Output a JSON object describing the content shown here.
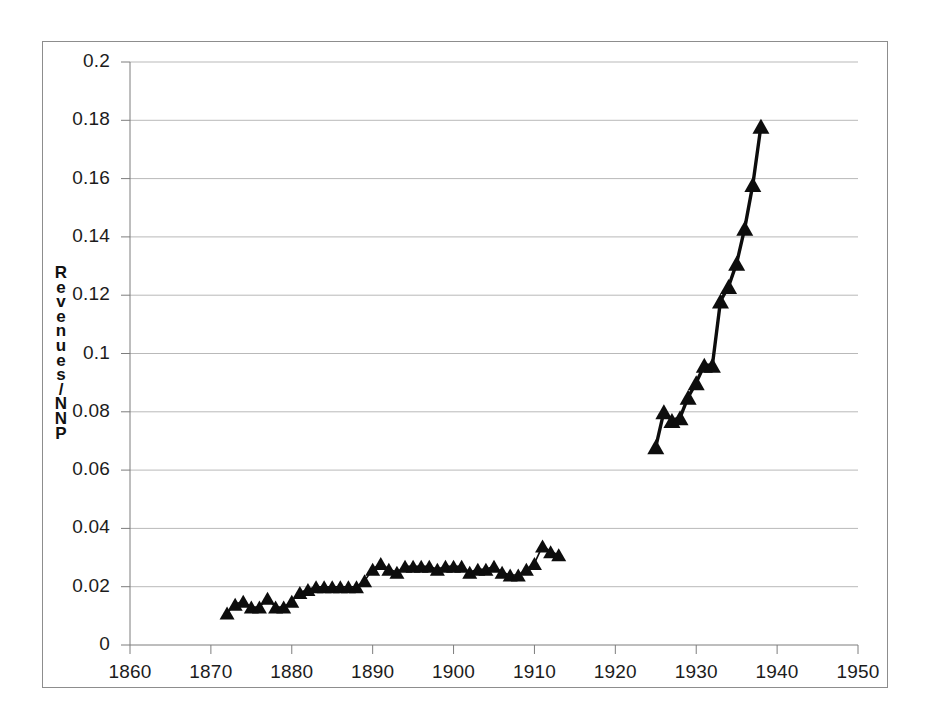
{
  "figure": {
    "background_color": "#ffffff",
    "frame_color": "#8d8d8d",
    "series_color": "#0d0d0d",
    "gridline_color": "#b9b9b9",
    "axis_color": "#7d7d7d"
  },
  "axis": {
    "ylabel_text": "Revenues/NNP",
    "ylabel_chars": [
      "R",
      "e",
      "v",
      "e",
      "n",
      "u",
      "e",
      "s",
      "/",
      "N",
      "N",
      "P"
    ],
    "ytick_labels": [
      "0.2",
      "0.18",
      "0.16",
      "0.14",
      "0.12",
      "0.1",
      "0.08",
      "0.06",
      "0.04",
      "0.02",
      "0"
    ],
    "xtick_labels": [
      "1860",
      "1870",
      "1880",
      "1890",
      "1900",
      "1910",
      "1920",
      "1930",
      "1940",
      "1950"
    ]
  },
  "chart_data": {
    "type": "line",
    "title": "",
    "subtitle": "",
    "xlabel": "",
    "ylabel": "Revenues/NNP",
    "xlim": [
      1860,
      1950
    ],
    "ylim": [
      0,
      0.2
    ],
    "xticks": [
      1860,
      1870,
      1880,
      1890,
      1900,
      1910,
      1920,
      1930,
      1940,
      1950
    ],
    "yticks": [
      0,
      0.02,
      0.04,
      0.06,
      0.08,
      0.1,
      0.12,
      0.14,
      0.16,
      0.18,
      0.2
    ],
    "grid": "horizontal",
    "legend": "none",
    "marker": "triangle",
    "series": [
      {
        "name": "Revenues/NNP (pre-war)",
        "x": [
          1872,
          1873,
          1874,
          1875,
          1876,
          1877,
          1878,
          1879,
          1880,
          1881,
          1882,
          1883,
          1884,
          1885,
          1886,
          1887,
          1888,
          1889,
          1890,
          1891,
          1892,
          1893,
          1894,
          1895,
          1896,
          1897,
          1898,
          1899,
          1900,
          1901,
          1902,
          1903,
          1904,
          1905,
          1906,
          1907,
          1908,
          1909,
          1910,
          1911,
          1912,
          1913
        ],
        "values": [
          0.011,
          0.014,
          0.015,
          0.013,
          0.013,
          0.016,
          0.013,
          0.013,
          0.015,
          0.018,
          0.019,
          0.02,
          0.02,
          0.02,
          0.02,
          0.02,
          0.02,
          0.022,
          0.026,
          0.028,
          0.026,
          0.025,
          0.027,
          0.027,
          0.027,
          0.027,
          0.026,
          0.027,
          0.027,
          0.027,
          0.025,
          0.026,
          0.026,
          0.027,
          0.025,
          0.024,
          0.024,
          0.026,
          0.028,
          0.034,
          0.032,
          0.031
        ]
      },
      {
        "name": "Revenues/NNP (interwar)",
        "x": [
          1925,
          1926,
          1927,
          1928,
          1929,
          1930,
          1931,
          1932,
          1933,
          1934,
          1935,
          1936,
          1937,
          1938
        ],
        "values": [
          0.068,
          0.08,
          0.077,
          0.078,
          0.085,
          0.09,
          0.096,
          0.096,
          0.118,
          0.123,
          0.131,
          0.143,
          0.158,
          0.178
        ]
      }
    ]
  }
}
